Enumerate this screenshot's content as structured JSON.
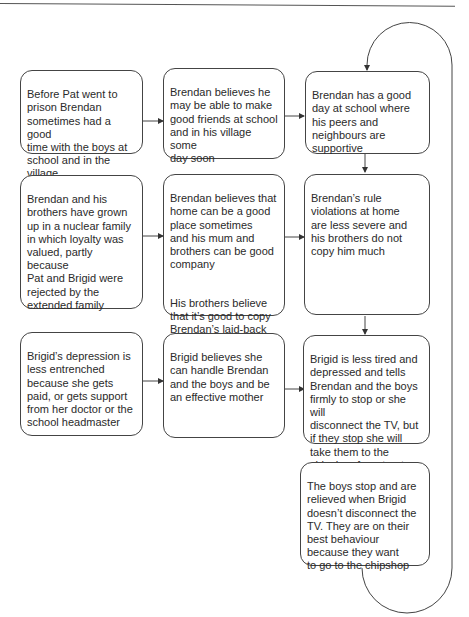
{
  "diagram": {
    "type": "flowchart",
    "rows": [
      {
        "boxes": [
          {
            "id": "r1c1",
            "text": "Before Pat went to\nprison Brendan\nsometimes had a good\ntime with the boys at\nschool and in the\nvillage"
          },
          {
            "id": "r1c2",
            "text": "Brendan believes he\nmay be able to make\ngood friends at school\nand in his village some\nday soon"
          },
          {
            "id": "r1c3",
            "text": "Brendan has a good\nday at school where\nhis peers and\nneighbours are\nsupportive"
          }
        ]
      },
      {
        "boxes": [
          {
            "id": "r2c1",
            "text": "Brendan and his\nbrothers have grown\nup in a nuclear family\nin which loyalty was\nvalued, partly because\nPat and Brigid were\nrejected by the\nextended family"
          },
          {
            "id": "r2c2",
            "text": "Brendan believes that\nhome can be a good\nplace sometimes\nand his mum and\nbrothers can be good\ncompany",
            "text2": "His brothers believe\nthat it’s good to copy\nBrendan’s laid-back\napproach to life"
          },
          {
            "id": "r2c3",
            "text": "Brendan’s rule\nviolations at home\nare less severe and\nhis brothers do not\ncopy him much"
          }
        ]
      },
      {
        "boxes": [
          {
            "id": "r3c1",
            "text": "Brigid’s depression is\nless entrenched\nbecause she gets\npaid, or gets support\nfrom her doctor or the\nschool headmaster"
          },
          {
            "id": "r3c2",
            "text": "Brigid believes she\ncan handle Brendan\nand the boys and be\nan effective mother"
          },
          {
            "id": "r3c3",
            "text": "Brigid is less tired and\ndepressed and tells\nBrendan and the boys\nfirmly to stop or she will\ndisconnect the TV, but\nif they stop she will\ntake them to the\nchipshop for a treat"
          }
        ]
      },
      {
        "boxes": [
          {
            "id": "r4c3",
            "text": "The boys stop and are\nrelieved when Brigid\ndoesn’t disconnect the\nTV. They are on their\nbest behaviour\nbecause they want\nto go to the chipshop"
          }
        ]
      }
    ],
    "connections": [
      {
        "from": "r1c1",
        "to": "r1c2"
      },
      {
        "from": "r1c2",
        "to": "r1c3"
      },
      {
        "from": "r2c1",
        "to": "r2c2"
      },
      {
        "from": "r2c2",
        "to": "r2c3"
      },
      {
        "from": "r3c1",
        "to": "r3c2"
      },
      {
        "from": "r3c2",
        "to": "r3c3"
      },
      {
        "from": "r1c3",
        "to": "r2c3"
      },
      {
        "from": "r2c3",
        "to": "r3c3"
      },
      {
        "from": "r4c3",
        "to": "r1c3",
        "style": "feedback-loop"
      }
    ],
    "colors": {
      "stroke": "#444444",
      "text": "#2a2a2a",
      "background": "#ffffff"
    }
  }
}
